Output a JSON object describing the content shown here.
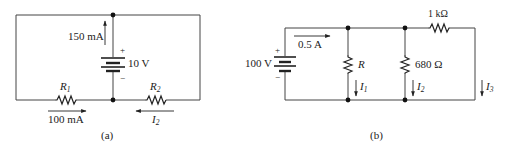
{
  "figure_a": {
    "caption": "(a)",
    "source": {
      "voltage": "10 V",
      "plus": "+",
      "minus": "−"
    },
    "source_current": "150 mA",
    "r1": {
      "name": "R",
      "sub": "1",
      "current": "100 mA"
    },
    "r2": {
      "name": "R",
      "sub": "2",
      "current_name": "I",
      "current_sub": "2"
    }
  },
  "figure_b": {
    "caption": "(b)",
    "source": {
      "voltage": "100 V",
      "plus": "+",
      "minus": "−"
    },
    "source_current": "0.5 A",
    "r_unknown": {
      "name": "R",
      "current_name": "I",
      "current_sub": "1"
    },
    "r_680": {
      "value": "680 Ω",
      "current_name": "I",
      "current_sub": "2"
    },
    "r_1k": {
      "value": "1 kΩ"
    },
    "branch3": {
      "current_name": "I",
      "current_sub": "3"
    }
  }
}
